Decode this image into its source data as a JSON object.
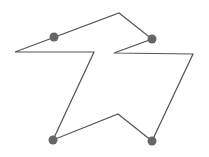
{
  "diagram": {
    "stroke_color": "#555555",
    "dot_color": "#666666",
    "stroke_width": 1.2,
    "dot_radius": 4.5,
    "polygon_points": [
      [
        15,
        52
      ],
      [
        94,
        52
      ],
      [
        53,
        140
      ],
      [
        118,
        114
      ],
      [
        152,
        141
      ],
      [
        193,
        54
      ],
      [
        114,
        53
      ],
      [
        152,
        39
      ],
      [
        119,
        13
      ]
    ],
    "control_points": [
      [
        54,
        37
      ],
      [
        152,
        39
      ],
      [
        53,
        140
      ],
      [
        152,
        141
      ]
    ]
  }
}
